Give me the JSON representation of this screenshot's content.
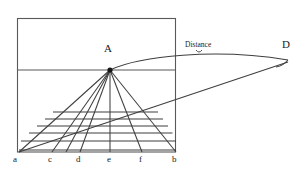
{
  "figure": {
    "type": "perspective-grid-diagram",
    "background_color": "#ffffff",
    "stroke_color": "#4a4a4a",
    "text_color": "#1b1b1b",
    "labels": {
      "vanishing_point": "A",
      "distance_point": "D",
      "distance_bracket": "Distance",
      "baseline_a": "a",
      "baseline_c": "c",
      "baseline_d": "d",
      "baseline_e": "e",
      "baseline_f": "f",
      "baseline_b": "b"
    },
    "geometry": {
      "frame": {
        "left": 17,
        "top": 18,
        "right": 176,
        "bottom": 152
      },
      "horizon_y": 70,
      "vanishing_point": {
        "x": 110,
        "y": 70
      },
      "distance_point": {
        "x": 288,
        "y": 62
      },
      "baseline_points": [
        {
          "name": "a",
          "x": 19,
          "y": 152
        },
        {
          "name": "c",
          "x": 52,
          "y": 152
        },
        {
          "name": "d",
          "x": 80,
          "y": 152
        },
        {
          "name": "e",
          "x": 110,
          "y": 152
        },
        {
          "name": "f",
          "x": 142,
          "y": 152
        },
        {
          "name": "b",
          "x": 176,
          "y": 152
        }
      ],
      "orthogonal_ray_count": 7,
      "transversal_line_count": 6,
      "transversal_y_values": [
        112,
        119,
        126,
        133,
        141,
        150
      ]
    }
  }
}
